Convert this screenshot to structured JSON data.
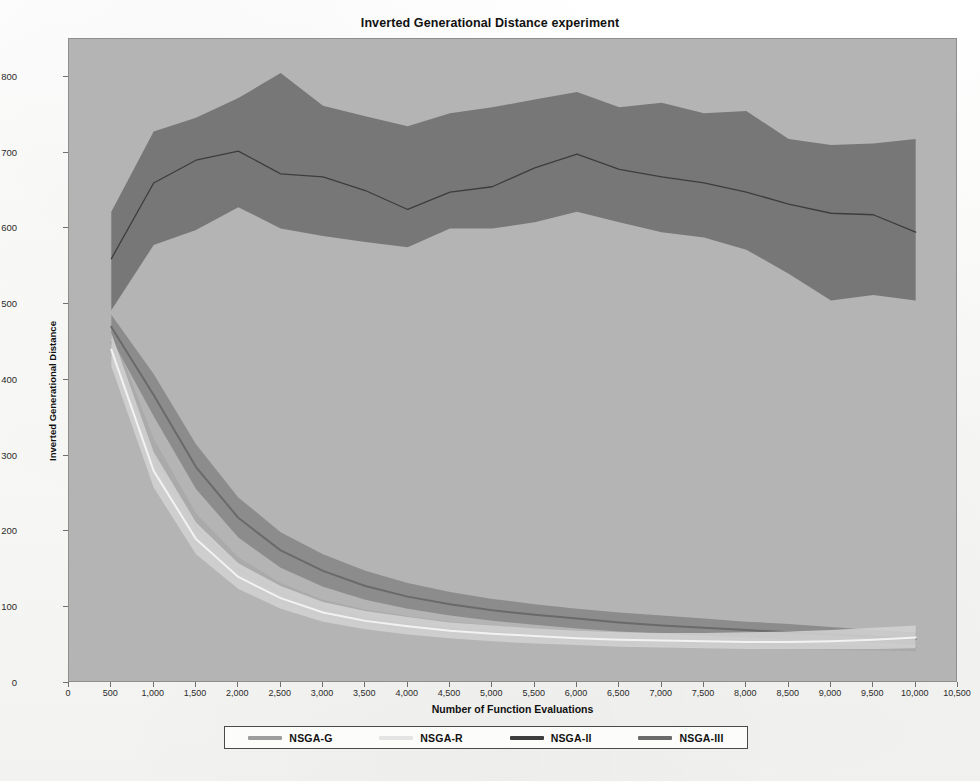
{
  "chart_data": {
    "type": "line",
    "title": "Inverted Generational Distance experiment",
    "xlabel": "Number of Function Evaluations",
    "ylabel": "Inverted Generational Distance",
    "xlim": [
      0,
      10500
    ],
    "ylim": [
      0,
      850
    ],
    "grid": false,
    "legend_position": "bottom",
    "xticks": [
      "0",
      "500",
      "1,000",
      "1,500",
      "2,000",
      "2,500",
      "3,000",
      "3,500",
      "4,000",
      "4,500",
      "5,000",
      "5,500",
      "6,000",
      "6,500",
      "7,000",
      "7,500",
      "8,000",
      "8,500",
      "9,000",
      "9,500",
      "10,000",
      "10,500"
    ],
    "xtick_values": [
      0,
      500,
      1000,
      1500,
      2000,
      2500,
      3000,
      3500,
      4000,
      4500,
      5000,
      5500,
      6000,
      6500,
      7000,
      7500,
      8000,
      8500,
      9000,
      9500,
      10000,
      10500
    ],
    "yticks": [
      "0",
      "100",
      "200",
      "300",
      "400",
      "500",
      "600",
      "700",
      "800"
    ],
    "ytick_values": [
      0,
      100,
      200,
      300,
      400,
      500,
      600,
      700,
      800
    ],
    "x": [
      500,
      1000,
      1500,
      2000,
      2500,
      3000,
      3500,
      4000,
      4500,
      5000,
      5500,
      6000,
      6500,
      7000,
      7500,
      8000,
      8500,
      9000,
      9500,
      10000
    ],
    "series": [
      {
        "name": "NSGA-G",
        "color": "#9d9d9d",
        "band_color": "#a8a8a8",
        "values": [
          450,
          300,
          205,
          150,
          118,
          98,
          86,
          78,
          72,
          67,
          63,
          60,
          57,
          55,
          53,
          52,
          50,
          49,
          48,
          47
        ],
        "band_lower": [
          432,
          280,
          188,
          136,
          106,
          88,
          77,
          70,
          64,
          59,
          56,
          53,
          51,
          49,
          47,
          46,
          45,
          44,
          43,
          42
        ],
        "band_upper": [
          468,
          322,
          224,
          166,
          132,
          110,
          97,
          88,
          81,
          76,
          71,
          68,
          64,
          62,
          60,
          58,
          56,
          55,
          54,
          53
        ]
      },
      {
        "name": "NSGA-R",
        "color": "#f2f2f2",
        "band_color": "#d2d2d2",
        "values": [
          440,
          280,
          190,
          140,
          112,
          93,
          82,
          75,
          69,
          65,
          62,
          59,
          57,
          56,
          55,
          54,
          54,
          55,
          57,
          60
        ],
        "band_lower": [
          418,
          258,
          170,
          124,
          98,
          81,
          71,
          64,
          59,
          55,
          52,
          50,
          48,
          47,
          46,
          45,
          45,
          45,
          45,
          46
        ],
        "band_upper": [
          462,
          305,
          212,
          158,
          128,
          107,
          95,
          87,
          80,
          76,
          72,
          69,
          67,
          66,
          66,
          67,
          68,
          70,
          73,
          76
        ]
      },
      {
        "name": "NSGA-II",
        "color": "#3d3d3d",
        "band_color": "#6e6e6e",
        "values": [
          560,
          660,
          690,
          702,
          672,
          668,
          650,
          625,
          648,
          655,
          680,
          698,
          678,
          668,
          660,
          648,
          632,
          620,
          618,
          595
        ],
        "band_lower": [
          492,
          578,
          598,
          628,
          600,
          590,
          582,
          575,
          600,
          600,
          608,
          622,
          608,
          595,
          588,
          572,
          540,
          505,
          512,
          505
        ],
        "band_upper": [
          622,
          728,
          746,
          772,
          805,
          762,
          748,
          735,
          752,
          760,
          770,
          780,
          760,
          766,
          752,
          755,
          718,
          710,
          712,
          718
        ]
      },
      {
        "name": "NSGA-III",
        "color": "#6a6a6a",
        "band_color": "#868686",
        "values": [
          470,
          380,
          285,
          218,
          175,
          148,
          128,
          114,
          104,
          96,
          90,
          85,
          80,
          76,
          73,
          70,
          67,
          64,
          61,
          58
        ],
        "band_lower": [
          455,
          352,
          256,
          192,
          152,
          127,
          110,
          98,
          89,
          82,
          77,
          72,
          68,
          65,
          62,
          60,
          57,
          55,
          53,
          50
        ],
        "band_upper": [
          486,
          408,
          315,
          245,
          199,
          170,
          148,
          132,
          120,
          111,
          104,
          98,
          93,
          89,
          85,
          81,
          78,
          74,
          70,
          67
        ]
      }
    ]
  },
  "colors": {
    "plot_background": "#b4b4b4",
    "page_background": "#fbfbfa",
    "axis": "#6f6f6f",
    "text": "#111111"
  },
  "legend": {
    "entries": [
      {
        "label": "NSGA-G",
        "color": "#9d9d9d"
      },
      {
        "label": "NSGA-R",
        "color": "#e4e4e4"
      },
      {
        "label": "NSGA-II",
        "color": "#3d3d3d"
      },
      {
        "label": "NSGA-III",
        "color": "#6a6a6a"
      }
    ]
  }
}
